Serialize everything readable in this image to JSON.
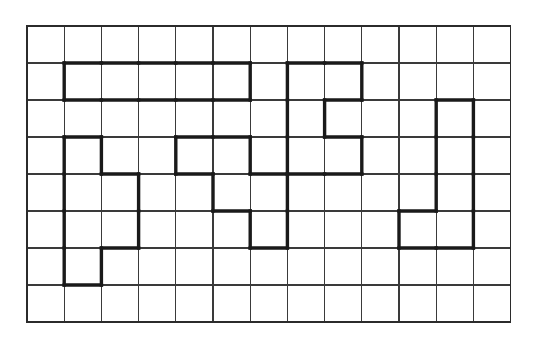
{
  "page": {
    "background_color": "#ffffff"
  },
  "grid": {
    "columns": 13,
    "rows": 8,
    "origin_x": 27,
    "origin_y": 26,
    "cell_width": 37.2,
    "cell_height": 37.0,
    "line_color": "#3a3a3a",
    "line_width": 1.3,
    "border_color": "#2b2b2b",
    "border_width": 1.6
  },
  "shapes": {
    "stroke_color": "#1a1a1a",
    "stroke_width": 3.4,
    "items": [
      {
        "name": "i-pentomino-horizontal-top-left",
        "cells": [
          [
            1,
            1
          ],
          [
            2,
            1
          ],
          [
            3,
            1
          ],
          [
            4,
            1
          ],
          [
            5,
            1
          ]
        ]
      },
      {
        "name": "u-shape-top-center",
        "cells": [
          [
            7,
            1
          ],
          [
            8,
            1
          ],
          [
            7,
            2
          ],
          [
            7,
            3
          ],
          [
            8,
            3
          ]
        ]
      },
      {
        "name": "p-pentomino-left",
        "cells": [
          [
            1,
            3
          ],
          [
            1,
            4
          ],
          [
            2,
            4
          ],
          [
            1,
            5
          ],
          [
            2,
            5
          ],
          [
            1,
            6
          ]
        ]
      },
      {
        "name": "z-shape-center",
        "cells": [
          [
            4,
            3
          ],
          [
            5,
            3
          ],
          [
            5,
            4
          ],
          [
            6,
            4
          ],
          [
            6,
            5
          ]
        ]
      },
      {
        "name": "j-shape-right",
        "cells": [
          [
            11,
            2
          ],
          [
            11,
            3
          ],
          [
            11,
            4
          ],
          [
            10,
            5
          ],
          [
            11,
            5
          ]
        ]
      }
    ]
  }
}
